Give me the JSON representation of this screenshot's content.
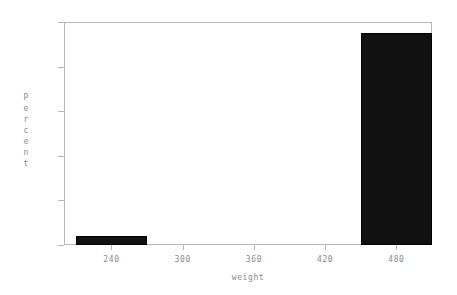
{
  "chart_data": {
    "type": "bar",
    "title": "",
    "subtitle": "",
    "xlabel": "weight",
    "ylabel": "Percent",
    "ylabel_letters": [
      "P",
      "e",
      "r",
      "c",
      "e",
      "n",
      "t"
    ],
    "xlim": [
      200,
      510
    ],
    "ylim": [
      0,
      100
    ],
    "yticks": [
      0,
      20,
      40,
      60,
      80,
      100
    ],
    "ytick_labels": [
      "0",
      "20",
      "40",
      "60",
      "80",
      "100"
    ],
    "xticks": [
      240,
      300,
      360,
      420,
      480
    ],
    "xtick_labels": [
      "240",
      "300",
      "360",
      "420",
      "480"
    ],
    "grid": false,
    "legend": null,
    "bar_color": "#111111",
    "axis_color": "#b9b9b9",
    "text_color": "#8a8a8a",
    "bins": [
      {
        "label": "210-270",
        "x_start": 210,
        "x_end": 270,
        "value": 4
      },
      {
        "label": "450-510",
        "x_start": 450,
        "x_end": 510,
        "value": 95
      }
    ],
    "categories": [
      "210-270",
      "450-510"
    ],
    "values": [
      4,
      95
    ]
  }
}
